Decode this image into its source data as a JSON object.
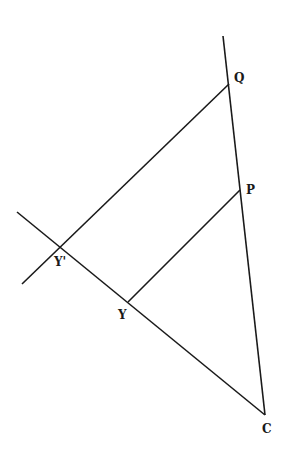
{
  "diagram": {
    "type": "geometry",
    "stroke_color": "#1a1a1a",
    "background": "#ffffff",
    "points": {
      "Q": {
        "label": "Q",
        "x": 229,
        "y": 84,
        "lx": 234,
        "ly": 82
      },
      "P": {
        "label": "P",
        "x": 240,
        "y": 190,
        "lx": 246,
        "ly": 194
      },
      "Y_prime": {
        "label": "Y'",
        "x": 60,
        "y": 247,
        "lx": 54,
        "ly": 266
      },
      "Y": {
        "label": "Y",
        "x": 128,
        "y": 302,
        "lx": 118,
        "ly": 319
      },
      "C": {
        "label": "C",
        "x": 265,
        "y": 415,
        "lx": 262,
        "ly": 433
      }
    },
    "lines": [
      {
        "name": "line-qc",
        "x1": 223,
        "y1": 36,
        "x2": 265,
        "y2": 415
      },
      {
        "name": "line-yc",
        "x1": 17,
        "y1": 212,
        "x2": 265,
        "y2": 415
      },
      {
        "name": "line-q-yprime",
        "x1": 229,
        "y1": 84,
        "x2": 22,
        "y2": 284
      },
      {
        "name": "segment-py",
        "x1": 240,
        "y1": 190,
        "x2": 128,
        "y2": 302
      }
    ]
  }
}
